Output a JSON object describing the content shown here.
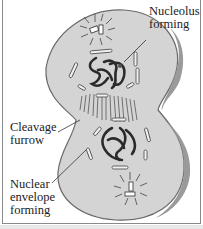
{
  "diagram": {
    "labels": [
      {
        "id": "nucleolus",
        "lines": [
          "Nucleolus",
          "forming"
        ]
      },
      {
        "id": "cleavage",
        "lines": [
          "Cleavage",
          "furrow"
        ]
      },
      {
        "id": "envelope",
        "lines": [
          "Nuclear",
          "envelope",
          "forming"
        ]
      }
    ],
    "colors": {
      "cell_fill": "#d4d4d4",
      "cell_edge": "#6a6a6a",
      "chromosome": "#2a2a2a",
      "background": "#ffffff"
    }
  }
}
